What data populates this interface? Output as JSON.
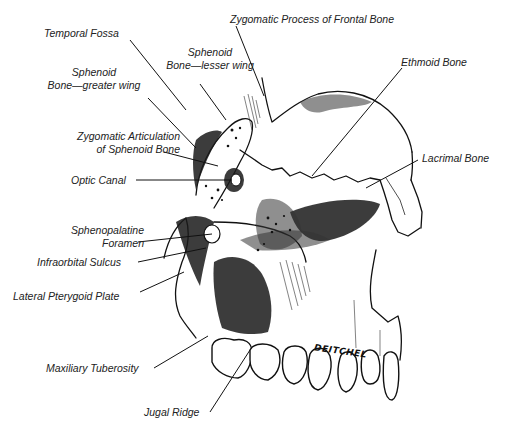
{
  "diagram": {
    "signature": "DEITCHEL",
    "labels": {
      "zygomatic_process_frontal": "Zygomatic Process of Frontal Bone",
      "temporal_fossa": "Temporal Fossa",
      "sphenoid_lesser_line1": "Sphenoid",
      "sphenoid_lesser_line2": "Bone—lesser wing",
      "sphenoid_greater_line1": "Sphenoid",
      "sphenoid_greater_line2": "Bone—greater wing",
      "ethmoid_bone": "Ethmoid Bone",
      "zygomatic_articulation_line1": "Zygomatic Articulation",
      "zygomatic_articulation_line2": "of Sphenoid Bone",
      "optic_canal": "Optic Canal",
      "lacrimal_bone": "Lacrimal Bone",
      "sphenopalatine_line1": "Sphenopalatine",
      "sphenopalatine_line2": "Foramen",
      "infraorbital_sulcus": "Infraorbital Sulcus",
      "lateral_pterygoid_plate": "Lateral Pterygoid Plate",
      "maxillary_tuberosity": "Maxiliary Tuberosity",
      "jugal_ridge": "Jugal Ridge"
    }
  }
}
